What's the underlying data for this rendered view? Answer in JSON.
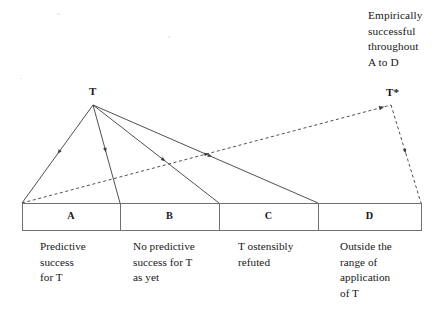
{
  "figure": {
    "annotation": {
      "lines": [
        "Empirically",
        "successful",
        "throughout",
        "A to D"
      ]
    },
    "nodes": [
      {
        "id": "apex",
        "label": "T",
        "x": 93,
        "y": 105
      },
      {
        "id": "tstar",
        "label": "T*",
        "x": 391,
        "y": 105
      }
    ],
    "bar": {
      "x": 22,
      "y": 203,
      "width": 399,
      "height": 27,
      "dividers": [
        120,
        219,
        318
      ]
    },
    "cells": [
      {
        "letter": "A",
        "left": 22,
        "right": 120,
        "caption_left": 40,
        "caption": [
          "Predictive",
          "success",
          "for T"
        ]
      },
      {
        "letter": "B",
        "left": 120,
        "right": 219,
        "caption_left": 133,
        "caption": [
          "No predictive",
          "success for T",
          "as yet"
        ]
      },
      {
        "letter": "C",
        "left": 219,
        "right": 318,
        "caption_left": 238,
        "caption": [
          "T ostensibly",
          "refuted"
        ]
      },
      {
        "letter": "D",
        "left": 318,
        "right": 421,
        "caption_left": 340,
        "caption": [
          "Outside the",
          "range of",
          "application",
          "of T"
        ]
      }
    ],
    "solid_edges": [
      {
        "name": "apex-to-A-left",
        "x1": 93,
        "y1": 105,
        "x2": 22,
        "y2": 203,
        "arrow_t": 0.48
      },
      {
        "name": "apex-to-AB-edge",
        "x1": 93,
        "y1": 105,
        "x2": 120,
        "y2": 203,
        "arrow_t": 0.46
      },
      {
        "name": "apex-to-BC-edge",
        "x1": 93,
        "y1": 105,
        "x2": 219,
        "y2": 203,
        "arrow_t": 0.56
      },
      {
        "name": "apex-to-CD-edge",
        "x1": 93,
        "y1": 105,
        "x2": 318,
        "y2": 203,
        "arrow_t": 0.52
      }
    ],
    "dashed_edges": [
      {
        "name": "A-left-to-tstar",
        "x1": 22,
        "y1": 203,
        "x2": 391,
        "y2": 105,
        "arrow_t": 0.5
      },
      {
        "name": "tstar-to-D-right",
        "x1": 391,
        "y1": 105,
        "x2": 421,
        "y2": 203,
        "arrow_t": 0.47
      }
    ],
    "style": {
      "stroke": "#3a3c40",
      "bar_stroke": "#6e7175",
      "background": "#ffffff",
      "stroke_width": 0.9,
      "dash_pattern": "3,2.6"
    }
  }
}
